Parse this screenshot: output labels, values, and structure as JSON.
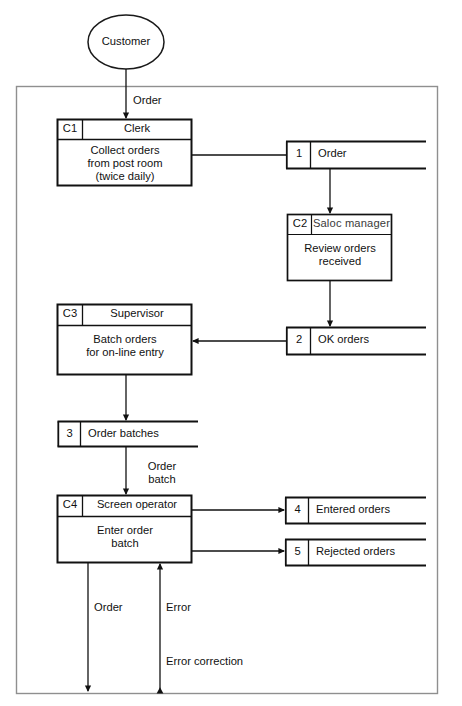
{
  "diagram": {
    "type": "data-flow-diagram",
    "external_entity": {
      "name": "customer-entity",
      "label": "Customer",
      "shape": "ellipse"
    },
    "system_boundary": {
      "name": "system-boundary-frame",
      "label": ""
    },
    "processes": [
      {
        "id": "C1",
        "role": "Clerk",
        "body": "Collect orders\nfrom post room\n(twice daily)",
        "body_lines": [
          "Collect orders",
          "from post room",
          "(twice daily)"
        ]
      },
      {
        "id": "C2",
        "role": "Saloc manager",
        "body": "Review orders\nreceived",
        "body_lines": [
          "Review orders",
          "received"
        ]
      },
      {
        "id": "C3",
        "role": "Supervisor",
        "body": "Batch orders\nfor on-line entry",
        "body_lines": [
          "Batch orders",
          "for on-line entry"
        ]
      },
      {
        "id": "C4",
        "role": "Screen operator",
        "body": "Enter order\nbatch",
        "body_lines": [
          "Enter order",
          "batch"
        ]
      }
    ],
    "data_stores": [
      {
        "id": "1",
        "label": "Order"
      },
      {
        "id": "2",
        "label": "OK orders"
      },
      {
        "id": "3",
        "label": "Order batches"
      },
      {
        "id": "4",
        "label": "Entered orders"
      },
      {
        "id": "5",
        "label": "Rejected orders"
      }
    ],
    "flow_labels": [
      {
        "name": "flow-order-in",
        "text": "Order"
      },
      {
        "name": "flow-order-batch",
        "text": "Order\nbatch",
        "lines": [
          "Order",
          "batch"
        ]
      },
      {
        "name": "flow-order-out",
        "text": "Order"
      },
      {
        "name": "flow-error",
        "text": "Error"
      },
      {
        "name": "flow-error-correction",
        "text": "Error correction"
      }
    ],
    "colors": {
      "ink": "#111111",
      "line": "#1a1a1a",
      "frame": "#8a8a8a",
      "paper": "#ffffff"
    }
  }
}
